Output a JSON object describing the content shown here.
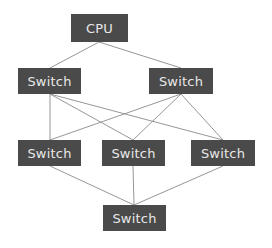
{
  "diagram": {
    "type": "network-topology",
    "colors": {
      "node_fill": "#4a4a4a",
      "node_text": "#e8e8e8",
      "edge": "#8a8a8a",
      "background": "#ffffff"
    },
    "nodes": [
      {
        "id": "cpu",
        "label": "CPU",
        "x": 71,
        "y": 14,
        "w": 57,
        "h": 28
      },
      {
        "id": "sw1l",
        "label": "Switch",
        "x": 18,
        "y": 68,
        "w": 63,
        "h": 26
      },
      {
        "id": "sw1r",
        "label": "Switch",
        "x": 149,
        "y": 68,
        "w": 64,
        "h": 26
      },
      {
        "id": "sw2l",
        "label": "Switch",
        "x": 18,
        "y": 140,
        "w": 63,
        "h": 26
      },
      {
        "id": "sw2m",
        "label": "Switch",
        "x": 102,
        "y": 140,
        "w": 63,
        "h": 26
      },
      {
        "id": "sw2r",
        "label": "Switch",
        "x": 191,
        "y": 140,
        "w": 64,
        "h": 26
      },
      {
        "id": "sw3",
        "label": "Switch",
        "x": 103,
        "y": 205,
        "w": 63,
        "h": 26
      }
    ],
    "edges": [
      [
        "cpu",
        "sw1l"
      ],
      [
        "cpu",
        "sw1r"
      ],
      [
        "sw1l",
        "sw2l"
      ],
      [
        "sw1l",
        "sw2m"
      ],
      [
        "sw1l",
        "sw2r"
      ],
      [
        "sw1r",
        "sw2l"
      ],
      [
        "sw1r",
        "sw2m"
      ],
      [
        "sw1r",
        "sw2r"
      ],
      [
        "sw2l",
        "sw3"
      ],
      [
        "sw2m",
        "sw3"
      ],
      [
        "sw2r",
        "sw3"
      ]
    ]
  }
}
